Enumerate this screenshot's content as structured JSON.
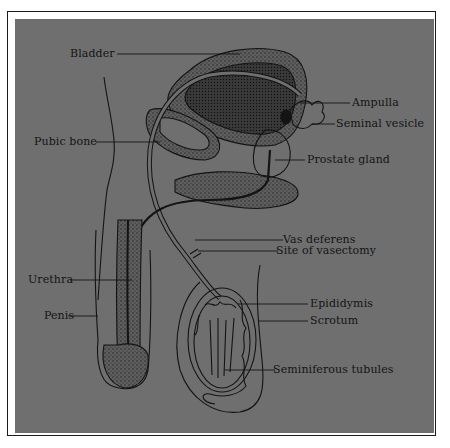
{
  "figure": {
    "background_color": "#6f6f6f",
    "ink_color": "#141414",
    "labels": [
      {
        "id": "bladder",
        "text": "Bladder"
      },
      {
        "id": "ampulla",
        "text": "Ampulla"
      },
      {
        "id": "seminal_vesicle",
        "text": "Seminal vesicle"
      },
      {
        "id": "pubic_bone",
        "text": "Pubic bone"
      },
      {
        "id": "prostate_gland",
        "text": "Prostate gland"
      },
      {
        "id": "vas_deferens",
        "text": "Vas deferens"
      },
      {
        "id": "site_of_vasectomy",
        "text": "Site of vasectomy"
      },
      {
        "id": "urethra",
        "text": "Urethra"
      },
      {
        "id": "epididymis",
        "text": "Epididymis"
      },
      {
        "id": "scrotum",
        "text": "Scrotum"
      },
      {
        "id": "penis",
        "text": "Penis"
      },
      {
        "id": "seminiferous_tubules",
        "text": "Seminiferous tubules"
      }
    ]
  }
}
